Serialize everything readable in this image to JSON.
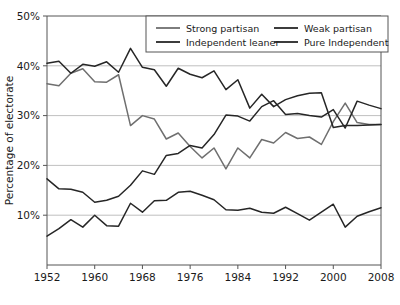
{
  "chart_data": {
    "type": "line",
    "title": "",
    "xlabel": "",
    "ylabel": "Percentage of electorate",
    "xlim": [
      1952,
      2008
    ],
    "ylim": [
      0,
      50
    ],
    "grid": true,
    "legend_position": "top-center",
    "xtick_labels": [
      "1952",
      "1960",
      "1968",
      "1976",
      "1984",
      "1992",
      "2000",
      "2008"
    ],
    "xtick_values": [
      1952,
      1960,
      1968,
      1976,
      1984,
      1992,
      2000,
      2008
    ],
    "ytick_labels": [
      "10%",
      "20%",
      "30%",
      "40%",
      "50%"
    ],
    "ytick_values": [
      10,
      20,
      30,
      40,
      50
    ],
    "x": [
      1952,
      1954,
      1956,
      1958,
      1960,
      1962,
      1964,
      1966,
      1968,
      1970,
      1972,
      1974,
      1976,
      1978,
      1980,
      1982,
      1984,
      1986,
      1988,
      1990,
      1992,
      1994,
      1996,
      1998,
      2000,
      2002,
      2004,
      2006,
      2008
    ],
    "series": [
      {
        "name": "Strong partisan",
        "color": "#6f6f6f",
        "values": [
          36.4,
          36.0,
          38.5,
          39.4,
          36.8,
          36.7,
          38.2,
          28.0,
          30.0,
          29.3,
          25.3,
          26.5,
          23.8,
          21.5,
          23.5,
          19.3,
          23.5,
          21.5,
          25.2,
          24.5,
          26.6,
          25.4,
          25.7,
          24.2,
          28.8,
          32.5,
          28.6,
          28.2,
          28.2
        ]
      },
      {
        "name": "Weak partisan",
        "color": "#262626",
        "values": [
          40.5,
          40.9,
          38.5,
          40.3,
          39.9,
          40.8,
          38.7,
          43.5,
          39.7,
          39.2,
          35.9,
          39.5,
          38.3,
          37.6,
          39.0,
          35.2,
          37.2,
          31.5,
          34.3,
          31.8,
          33.2,
          34.0,
          34.5,
          34.6,
          27.6,
          28.0,
          28.0,
          28.1,
          28.2
        ]
      },
      {
        "name": "Independent leaner",
        "color": "#262626",
        "values": [
          17.3,
          15.3,
          15.2,
          14.6,
          12.6,
          13.0,
          13.8,
          16.0,
          18.9,
          18.2,
          22.0,
          22.4,
          24.0,
          23.5,
          26.2,
          30.1,
          29.9,
          28.9,
          31.8,
          33.0,
          30.2,
          30.4,
          30.0,
          29.7,
          31.2,
          27.5,
          32.9,
          32.1,
          31.4
        ]
      },
      {
        "name": "Pure Independent",
        "color": "#262626",
        "values": [
          5.8,
          7.3,
          9.1,
          7.6,
          10.0,
          7.9,
          7.8,
          12.4,
          10.6,
          12.9,
          13.0,
          14.6,
          14.8,
          14.0,
          13.1,
          11.1,
          11.0,
          11.4,
          10.6,
          10.4,
          11.6,
          10.3,
          9.0,
          10.6,
          12.2,
          7.6,
          9.8,
          10.7,
          11.5
        ]
      }
    ]
  }
}
